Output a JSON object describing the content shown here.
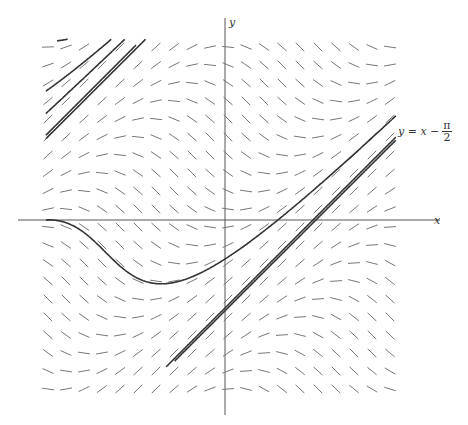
{
  "diagram": {
    "equation": "dy/dx = sin(x - y)",
    "axes": {
      "x_label": "x",
      "y_label": "y",
      "origin_px": [
        225,
        220
      ],
      "scale_px_per_unit": 56
    },
    "asymptote_label": {
      "lhs": "y = x −",
      "frac_num": "π",
      "frac_den": "2"
    },
    "field": {
      "x_start_px": 48,
      "y_start_px": 47,
      "spacing_px": 18,
      "cols": 20,
      "rows": 20,
      "segment_len_px": 12,
      "color": "#777777"
    },
    "curve_color": "#333333",
    "axis_color": "#555555",
    "solution_curves": [
      {
        "x0": -3.0,
        "y0": 3.2,
        "x1": 0.5
      },
      {
        "x0": -3.2,
        "y0": 2.3,
        "x1": 3.2
      },
      {
        "x0": -3.2,
        "y0": 1.45,
        "x1": 3.2
      },
      {
        "x0": -3.2,
        "y0": 0.0,
        "x1": 3.2
      },
      {
        "x0": -3.2,
        "y0": 1.9,
        "x1": 3.2
      },
      {
        "x0": 1.3,
        "y0": 3.3,
        "x1": 3.2
      },
      {
        "x0": -1.0,
        "y0": -3.15,
        "x1": 3.2
      },
      {
        "x0": -0.5,
        "y0": -3.15,
        "x1": 3.2
      },
      {
        "x0": 0.0,
        "y0": -3.15,
        "x1": 2.5
      },
      {
        "x0": 0.3,
        "y0": -3.25,
        "x1": 1.3
      },
      {
        "x0": 0.45,
        "y0": -3.35,
        "x1": 0.8
      },
      {
        "x0": -1.0,
        "y0": -2.85,
        "x1": -1.0
      },
      {
        "x0": 0.5,
        "y0": -3.0,
        "x1": 0.5
      }
    ],
    "asymptote_lines": [
      {
        "x0": -1.05,
        "x1": 3.2,
        "offset": -1.5708
      },
      {
        "x0": -0.9,
        "x1": 3.2,
        "offset": -1.62
      },
      {
        "x0": -3.2,
        "x1": -1.6,
        "offset": 4.7124
      }
    ]
  }
}
